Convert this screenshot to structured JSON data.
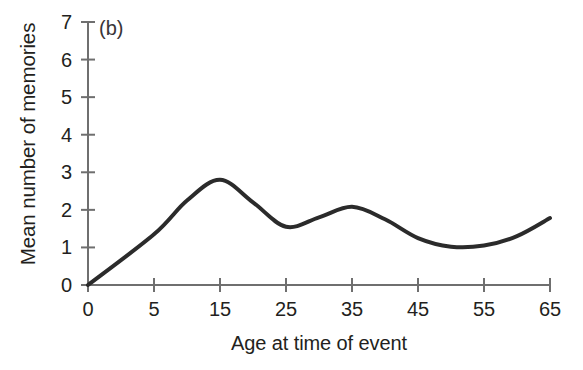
{
  "figure": {
    "panel_tag": "(b)",
    "background_color": "#ffffff"
  },
  "chart_data": {
    "type": "line",
    "title": "",
    "panel_label": "(b)",
    "xlabel": "Age at time of event",
    "ylabel": "Mean number of memories",
    "grid": false,
    "legend": null,
    "axis_color": "#6f6f6f",
    "line_color": "#2b2b2b",
    "line_width": 4,
    "xlim": [
      0,
      65
    ],
    "ylim": [
      0,
      7
    ],
    "x_tick_labels": [
      "0",
      "5",
      "15",
      "25",
      "35",
      "45",
      "55",
      "65"
    ],
    "x_tick_values": [
      0,
      5,
      15,
      25,
      35,
      45,
      55,
      65
    ],
    "x_axis_spacing": "even (categorical tick placement; 0-to-5 interval drawn same width as 10-year intervals)",
    "y_tick_labels": [
      "0",
      "1",
      "2",
      "3",
      "4",
      "5",
      "6",
      "7"
    ],
    "y_tick_values": [
      0,
      1,
      2,
      3,
      4,
      5,
      6,
      7
    ],
    "series": [
      {
        "name": "Mean number of memories",
        "x": [
          0,
          5,
          10,
          15,
          20,
          25,
          30,
          35,
          40,
          45,
          50,
          55,
          60,
          65
        ],
        "values": [
          0.0,
          1.35,
          2.25,
          2.8,
          2.2,
          1.55,
          1.8,
          2.08,
          1.75,
          1.25,
          1.02,
          1.05,
          1.3,
          1.78
        ]
      }
    ],
    "annotations": [
      {
        "label": "primary peak",
        "x": 15,
        "y": 2.8
      },
      {
        "label": "local minimum",
        "x": 25,
        "y": 1.55
      },
      {
        "label": "secondary peak",
        "x": 35,
        "y": 2.08
      },
      {
        "label": "trough",
        "x": 52,
        "y": 1.0
      },
      {
        "label": "recency rise",
        "x": 65,
        "y": 1.78
      }
    ]
  }
}
